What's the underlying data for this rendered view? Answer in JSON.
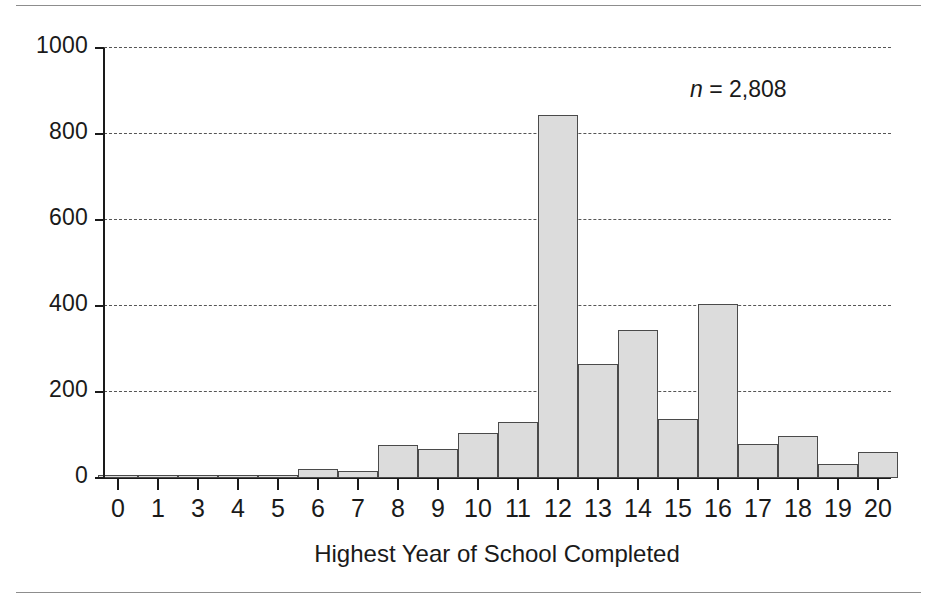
{
  "chart_data": {
    "type": "bar",
    "title": "",
    "subtitle": "",
    "xlabel": "Highest Year of School Completed",
    "ylabel": "",
    "categories": [
      "0",
      "1",
      "3",
      "4",
      "5",
      "6",
      "7",
      "8",
      "9",
      "10",
      "11",
      "12",
      "13",
      "14",
      "15",
      "16",
      "17",
      "18",
      "19",
      "20"
    ],
    "values": [
      2,
      8,
      6,
      5,
      4,
      20,
      16,
      76,
      68,
      105,
      130,
      845,
      265,
      345,
      138,
      405,
      78,
      98,
      33,
      60
    ],
    "xlim": [
      -0.5,
      19.5
    ],
    "ylim": [
      0,
      1000
    ],
    "yticks": [
      0,
      200,
      400,
      600,
      800,
      1000
    ],
    "ytick_labels": [
      "0",
      "200",
      "400",
      "600",
      "800",
      "1000"
    ],
    "xtick_labels": [
      "0",
      "1",
      "3",
      "4",
      "5",
      "6",
      "7",
      "8",
      "9",
      "10",
      "11",
      "12",
      "13",
      "14",
      "15",
      "16",
      "17",
      "18",
      "19",
      "20"
    ],
    "grid": "horizontal-dashed",
    "legend": "none",
    "annotations": [
      {
        "text_italic": "n",
        "text": " = 2,808",
        "full": "n = 2,808"
      }
    ],
    "colors": {
      "bar_fill": "#dcdcdc",
      "bar_edge": "#4a4a4a",
      "axis": "#1a1a1a",
      "gridline": "#555555",
      "background": "#ffffff"
    }
  },
  "annotation": {
    "symbol": "n",
    "rest": " = 2,808"
  },
  "axis": {
    "x_title": "Highest Year of School Completed"
  }
}
